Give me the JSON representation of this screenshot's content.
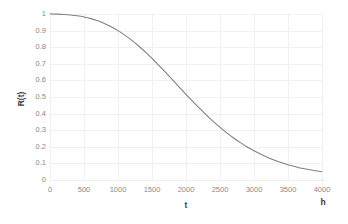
{
  "chart_data": {
    "type": "line",
    "title": "",
    "xlabel": "t",
    "ylabel": "R(t)",
    "x_unit": "h",
    "xlim": [
      0,
      4000
    ],
    "ylim": [
      0,
      1
    ],
    "grid": true,
    "legend": false,
    "line_color": "#808080",
    "x_ticks": [
      "0",
      "500",
      "1000",
      "1500",
      "2000",
      "2500",
      "3000",
      "3500",
      "4000"
    ],
    "x_tick_values": [
      0,
      500,
      1000,
      1500,
      2000,
      2500,
      3000,
      3500,
      4000
    ],
    "y_ticks": [
      "0",
      "0.1",
      "0.2",
      "0.3",
      "0.4",
      "0.5",
      "0.6",
      "0.7",
      "0.8",
      "0.9",
      "1"
    ],
    "y_tick_values": [
      0,
      0.1,
      0.2,
      0.3,
      0.4,
      0.5,
      0.6,
      0.7,
      0.8,
      0.9,
      1
    ],
    "series": [
      {
        "name": "R(t)",
        "x": [
          0,
          100,
          200,
          300,
          400,
          500,
          600,
          700,
          800,
          900,
          1000,
          1100,
          1200,
          1300,
          1400,
          1500,
          1600,
          1700,
          1800,
          1900,
          2000,
          2100,
          2200,
          2300,
          2400,
          2500,
          2600,
          2700,
          2800,
          2900,
          3000,
          3100,
          3200,
          3300,
          3400,
          3500,
          3600,
          3700,
          3800,
          3900,
          4000
        ],
        "values": [
          1.0,
          0.999,
          0.997,
          0.994,
          0.989,
          0.982,
          0.972,
          0.959,
          0.943,
          0.923,
          0.9,
          0.873,
          0.843,
          0.809,
          0.772,
          0.733,
          0.691,
          0.648,
          0.604,
          0.56,
          0.516,
          0.473,
          0.431,
          0.391,
          0.353,
          0.317,
          0.284,
          0.253,
          0.225,
          0.199,
          0.176,
          0.155,
          0.136,
          0.12,
          0.105,
          0.092,
          0.081,
          0.071,
          0.063,
          0.056,
          0.05
        ]
      }
    ]
  }
}
